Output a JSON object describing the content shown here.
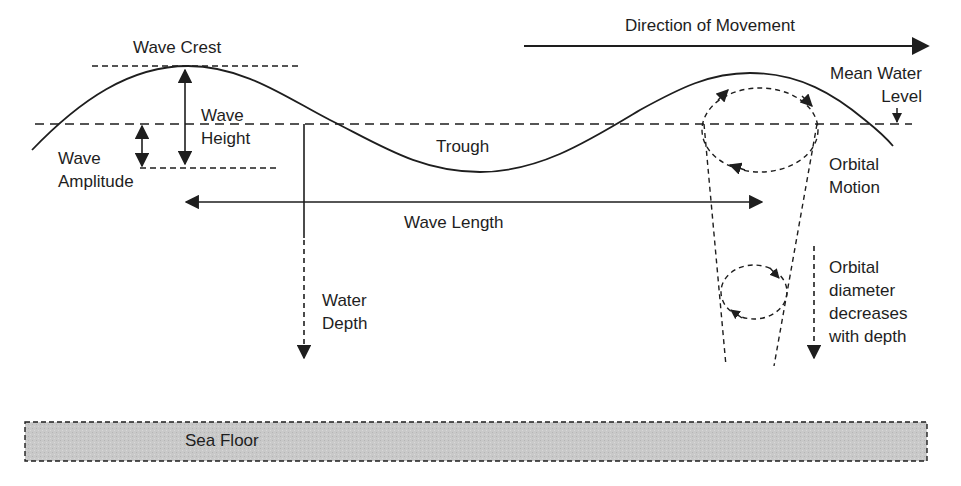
{
  "diagram": {
    "type": "ocean-wave-anatomy",
    "labels": {
      "wave_crest": "Wave Crest",
      "wave_height": "Wave\nHeight",
      "wave_amplitude": "Wave\nAmplitude",
      "trough": "Trough",
      "wave_length": "Wave Length",
      "water_depth": "Water\nDepth",
      "direction_of_movement": "Direction of Movement",
      "mean_water_level": "Mean Water\nLevel",
      "orbital_motion": "Orbital\nMotion",
      "orbital_diameter": "Orbital\ndiameter\ndecreases\nwith depth",
      "sea_floor": "Sea Floor"
    },
    "colors": {
      "line": "#1e1e1e",
      "sea_floor_fill": "#c8c8c8",
      "background": "#ffffff"
    }
  }
}
